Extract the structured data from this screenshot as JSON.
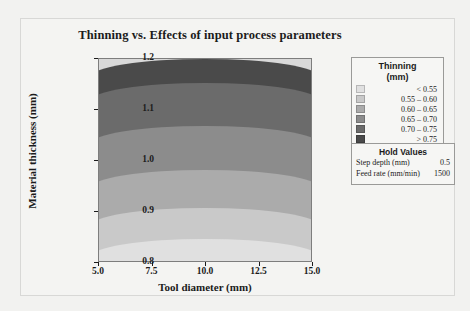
{
  "chart_data": {
    "type": "heatmap",
    "title": "Thinning vs. Effects of input process parameters",
    "xlabel": "Tool diameter (mm)",
    "ylabel": "Material thickness (mm)",
    "xlim": [
      5.0,
      15.0
    ],
    "ylim": [
      0.8,
      1.2
    ],
    "xticks": [
      "5.0",
      "7.5",
      "10.0",
      "12.5",
      "15.0"
    ],
    "yticks": [
      "1.2",
      "1.1",
      "1.0",
      "0.9",
      "0.8"
    ],
    "grid": false,
    "legend_position": "right",
    "legend": {
      "title": "Thinning",
      "units": "(mm)",
      "entries": [
        {
          "label": "<  0.55",
          "color": "#e0e0e0",
          "min": null,
          "max": 0.55
        },
        {
          "label": "0.55  –  0.60",
          "color": "#c9c9c9",
          "min": 0.55,
          "max": 0.6
        },
        {
          "label": "0.60  –  0.65",
          "color": "#ababab",
          "min": 0.6,
          "max": 0.65
        },
        {
          "label": "0.65  –  0.70",
          "color": "#8c8c8c",
          "min": 0.65,
          "max": 0.7
        },
        {
          "label": "0.70  –  0.75",
          "color": "#6b6b6b",
          "min": 0.7,
          "max": 0.75
        },
        {
          "label": ">  0.75",
          "color": "#4a4a4a",
          "min": 0.75,
          "max": null
        }
      ]
    },
    "bands": [
      {
        "name": "gt-0.75",
        "color": "#4a4a4a",
        "top_pct": 0,
        "height_pct": 22
      },
      {
        "name": "0.70-0.75",
        "color": "#6b6b6b",
        "top_pct": 12,
        "height_pct": 27
      },
      {
        "name": "0.65-0.70",
        "color": "#8c8c8c",
        "top_pct": 33,
        "height_pct": 28
      },
      {
        "name": "0.60-0.65",
        "color": "#ababab",
        "top_pct": 55,
        "height_pct": 26
      },
      {
        "name": "0.55-0.60",
        "color": "#c9c9c9",
        "top_pct": 74,
        "height_pct": 22
      },
      {
        "name": "lt-0.55",
        "color": "#e0e0e0",
        "top_pct": 89,
        "height_pct": 20
      }
    ],
    "hold_values": {
      "title": "Hold Values",
      "rows": [
        {
          "label": "Step depth (mm)",
          "value": "0.5"
        },
        {
          "label": "Feed rate (mm/min)",
          "value": "1500"
        }
      ]
    }
  }
}
